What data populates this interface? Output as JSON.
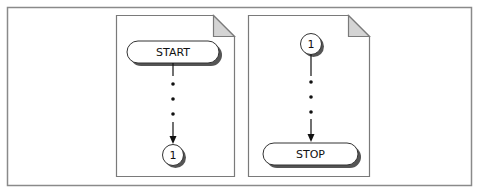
{
  "figure": {
    "pages": [
      {
        "id": "left",
        "terminator_label": "START",
        "connector_label": "1",
        "flow": "terminator-to-connector"
      },
      {
        "id": "right",
        "connector_label": "1",
        "terminator_label": "STOP",
        "flow": "connector-to-terminator"
      }
    ],
    "colors": {
      "frame": "#8a8a8a",
      "page_border": "#7a7a7a",
      "fold_fill": "#d4d4d4",
      "shadow": "#555555",
      "line": "#111111"
    }
  }
}
